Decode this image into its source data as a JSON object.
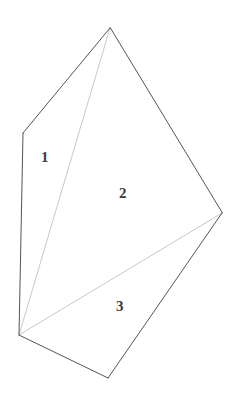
{
  "figure": {
    "name": "subdivided-polygon-diagram",
    "canvas": {
      "width": 241,
      "height": 394
    },
    "background_color": "#ffffff",
    "outline_color": "#555555",
    "internal_line_color": "#c9c9c9",
    "label_color": "#3b3b3b",
    "outline_width": 1,
    "internal_line_width": 1,
    "vertices": {
      "apex": {
        "x": 110,
        "y": 28
      },
      "left_upper": {
        "x": 23,
        "y": 133
      },
      "bottom_left": {
        "x": 19,
        "y": 335
      },
      "bottom": {
        "x": 108,
        "y": 378
      },
      "right": {
        "x": 222,
        "y": 213
      }
    },
    "outline_path": "M 110 28 L 23 133 L 19 335 L 108 378 L 222 213 Z",
    "internal_edges": [
      {
        "name": "diagonal-bottomleft-to-apex",
        "path": "M 19 335 L 110 28"
      },
      {
        "name": "diagonal-bottomleft-to-right",
        "path": "M 19 335 L 222 213"
      }
    ],
    "regions": [
      {
        "id": "region-1",
        "label": "1",
        "x": 41,
        "y": 150
      },
      {
        "id": "region-2",
        "label": "2",
        "x": 119,
        "y": 186
      },
      {
        "id": "region-3",
        "label": "3",
        "x": 116,
        "y": 299
      }
    ]
  }
}
